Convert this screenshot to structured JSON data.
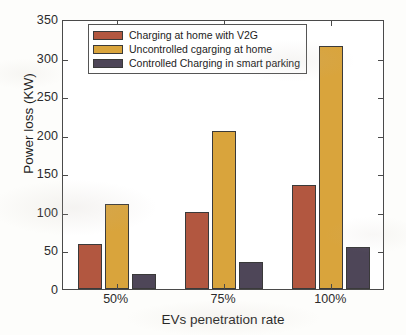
{
  "chart_data": {
    "type": "bar",
    "title": "",
    "subtitle": "",
    "xlabel": "EVs penetration rate",
    "ylabel": "Power loss (KW)",
    "categories": [
      "50%",
      "75%",
      "100%"
    ],
    "series": [
      {
        "name": "Charging at home with V2G",
        "color": "#B25740",
        "values": [
          58,
          100,
          135
        ]
      },
      {
        "name": "Uncontrolled cgarging at home",
        "color": "#D9A43C",
        "values": [
          110,
          205,
          315
        ]
      },
      {
        "name": "Controlled Charging in smart parking",
        "color": "#4E4658",
        "values": [
          20,
          35,
          55
        ]
      }
    ],
    "ylim": [
      0,
      350
    ],
    "yticks": [
      0,
      50,
      100,
      150,
      200,
      250,
      300,
      350
    ],
    "ytick_labels": [
      "0",
      "50",
      "100",
      "150",
      "200",
      "250",
      "300",
      "350"
    ],
    "xtick_labels": [
      "50%",
      "75%",
      "100%"
    ],
    "grid": false,
    "legend_position": "top-left",
    "legend_entries": [
      "Charging at home with V2G",
      "Uncontrolled cgarging at home",
      "Controlled Charging in smart parking"
    ],
    "axis_color": "#4a4a4a",
    "background": "#ffffff"
  }
}
